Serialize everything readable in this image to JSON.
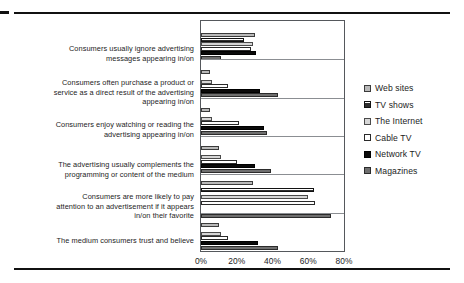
{
  "chart_data": {
    "type": "bar",
    "orientation": "horizontal",
    "title": "",
    "xlabel": "",
    "ylabel": "",
    "xlim": [
      0,
      80
    ],
    "xticks": [
      "0%",
      "20%",
      "40%",
      "60%",
      "80%"
    ],
    "xtick_values": [
      0,
      20,
      40,
      60,
      80
    ],
    "grid": false,
    "legend_position": "right",
    "categories": [
      "Consumers usually ignore advertising messages appearing in/on",
      "Consumers often purchase a product or service as a direct result of the advertising appearing in/on",
      "Consumers enjoy watching or reading the advertising appearing in/on",
      "The advertising usually complements the programming or content of the medium",
      "Consumers are more likely to pay attention to an advertisement if it appears in/on their favorite",
      "The medium consumers trust and believe"
    ],
    "series": [
      {
        "name": "Web sites",
        "color": "#b9b9b9",
        "values": [
          30,
          5,
          5,
          10,
          29,
          10
        ]
      },
      {
        "name": "TV shows",
        "color": "#2f2f2f",
        "values": [
          24,
          0,
          0,
          0,
          63,
          0
        ]
      },
      {
        "name": "The Internet",
        "color": "#d6d6d6",
        "values": [
          29,
          6,
          6,
          11,
          60,
          11
        ]
      },
      {
        "name": "Cable TV",
        "color": "#ffffff",
        "values": [
          28,
          15,
          21,
          20,
          64,
          15
        ]
      },
      {
        "name": "Network TV",
        "color": "#0a0a0a",
        "values": [
          31,
          33,
          35,
          30,
          0,
          32
        ]
      },
      {
        "name": "Magazines",
        "color": "#6f6f6f",
        "values": [
          11,
          43,
          37,
          39,
          73,
          43
        ]
      }
    ]
  },
  "legend": {
    "items": [
      {
        "label": "Web sites",
        "swatch": "legend-swatch-web-sites"
      },
      {
        "label": "TV shows",
        "swatch": "legend-swatch-tv-shows"
      },
      {
        "label": "The Internet",
        "swatch": "legend-swatch-the-internet"
      },
      {
        "label": "Cable TV",
        "swatch": "legend-swatch-cable-tv"
      },
      {
        "label": "Network TV",
        "swatch": "legend-swatch-network-tv"
      },
      {
        "label": "Magazines",
        "swatch": "legend-swatch-magazines"
      }
    ]
  },
  "category_labels": [
    [
      "Consumers usually ignore advertising",
      "messages appearing in/on"
    ],
    [
      "Consumers often purchase a product or",
      "service as a direct result of the advertising",
      "appearing in/on"
    ],
    [
      "Consumers enjoy watching or reading the",
      "advertising appearing in/on"
    ],
    [
      "The advertising usually complements the",
      "programming or content of the medium"
    ],
    [
      "Consumers are more likely to pay",
      "attention to an advertisement if it appears",
      "in/on their favorite"
    ],
    [
      "The medium consumers trust and believe"
    ]
  ]
}
